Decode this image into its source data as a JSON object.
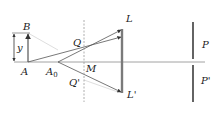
{
  "diagram": {
    "type": "optics-ray-diagram",
    "colors": {
      "axis": "#8a8a8a",
      "ray": "#555555",
      "faint_ray": "#c8c8c8",
      "arrow": "#333333",
      "dashed": "#9a9a9a",
      "lens": "#7a7a7a",
      "screen": "#222222",
      "label": "#222222"
    },
    "labels": {
      "B": "B",
      "A": "A",
      "A0_main": "A",
      "A0_sub": "0",
      "y": "y",
      "Q": "Q",
      "Q_prime": "Q'",
      "M": "M",
      "L": "L",
      "L_prime": "L'",
      "P": "P",
      "P_prime": "P'"
    },
    "geometry": {
      "axis_y": 62,
      "axis_x_start": 14,
      "axis_x_end": 205,
      "object_x": 28,
      "object_top": 33,
      "dim_x": 14,
      "A0_x": 58,
      "slit_x": 84,
      "slit_top": 20,
      "slit_bottom": 102,
      "lens_x": 122,
      "lens_top": 29,
      "lens_bottom": 93,
      "screen_x": 193,
      "screen_top": 22,
      "screen_bottom": 102,
      "screen_gap": 6
    }
  }
}
